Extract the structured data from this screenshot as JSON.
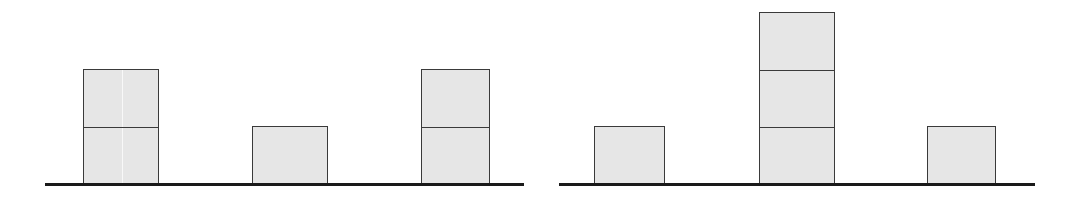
{
  "diagram": {
    "colors": {
      "block_fill": "#e6e6e6",
      "block_border": "#3a3a3a",
      "baseline": "#1a1a1a",
      "background": "#ffffff"
    },
    "unit_height_px": 57,
    "panels": [
      {
        "name": "left",
        "baseline": {
          "x1": 45,
          "x2": 524,
          "y": 183
        },
        "stacks": [
          {
            "x": 83,
            "width": 76,
            "count": 2
          },
          {
            "x": 252,
            "width": 76,
            "count": 1
          },
          {
            "x": 421,
            "width": 69,
            "count": 2
          }
        ]
      },
      {
        "name": "right",
        "baseline": {
          "x1": 559,
          "x2": 1035,
          "y": 183
        },
        "stacks": [
          {
            "x": 594,
            "width": 71,
            "count": 1
          },
          {
            "x": 759,
            "width": 76,
            "count": 3
          },
          {
            "x": 927,
            "width": 69,
            "count": 1
          }
        ]
      }
    ]
  }
}
